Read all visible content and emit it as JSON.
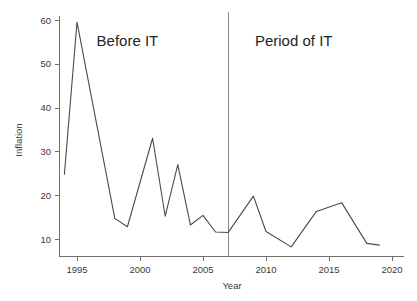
{
  "chart_data": {
    "type": "line",
    "title": "",
    "xlabel": "Year",
    "ylabel": "Inflation",
    "xlim": [
      1993.6,
      2020.5
    ],
    "ylim": [
      7.0,
      62.0
    ],
    "grid": false,
    "legend": null,
    "x_ticks": [
      1995,
      2000,
      2005,
      2010,
      2015,
      2020
    ],
    "x_tick_labels": [
      "1995",
      "2000",
      "2005",
      "2010",
      "2015",
      "2020"
    ],
    "y_ticks": [
      10,
      20,
      30,
      40,
      50,
      60
    ],
    "y_tick_labels": [
      "10",
      "20",
      "30",
      "40",
      "50",
      "60"
    ],
    "series": [
      {
        "name": "Inflation",
        "color": "#4a4a4a",
        "x": [
          1994,
          1995,
          1998,
          1999,
          2001,
          2002,
          2003,
          2004,
          2005,
          2006,
          2007,
          2009,
          2010,
          2012,
          2014,
          2016,
          2018,
          2019
        ],
        "values": [
          24.8,
          59.5,
          14.7,
          12.8,
          33.0,
          15.2,
          27.0,
          13.2,
          15.4,
          11.6,
          11.5,
          19.8,
          11.7,
          8.2,
          16.3,
          18.3,
          9.0,
          8.6
        ]
      }
    ],
    "annotations": [
      {
        "name": "before-it",
        "text": "Before IT",
        "x": 1999.0,
        "y": 54.0
      },
      {
        "name": "period-of-it",
        "text": "Period of IT",
        "x": 2012.2,
        "y": 54.0
      }
    ],
    "vertical_divider": {
      "name": "it-start-divider",
      "x": 2007,
      "color": "#8a8a8a"
    }
  }
}
